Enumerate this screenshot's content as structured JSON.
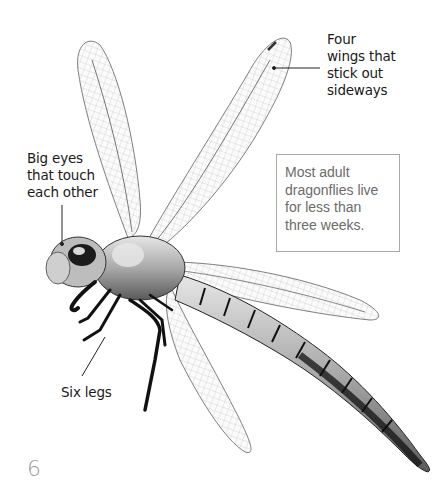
{
  "labels": {
    "wings": "Four\nwings that\nstick out\nsideways",
    "eyes": "Big eyes\nthat touch\neach other",
    "legs": "Six legs"
  },
  "fact_box": {
    "text": "Most adult\ndragonflies live\nfor less than\nthree weeks."
  },
  "page_number": "6",
  "illustration": {
    "subject": "dragonfly",
    "colors": {
      "wing_vein": "#8a8a8a",
      "body_light": "#d8d8d8",
      "body_dark": "#1a1a1a",
      "leader_line": "#222222"
    }
  }
}
